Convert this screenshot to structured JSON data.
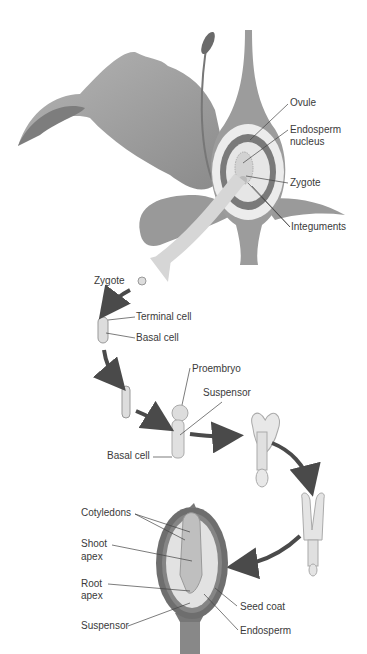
{
  "diagram": {
    "flower_labels": {
      "ovule": "Ovule",
      "endosperm_nucleus_line1": "Endosperm",
      "endosperm_nucleus_line2": "nucleus",
      "zygote": "Zygote",
      "integuments": "Integuments"
    },
    "stage_labels": {
      "zygote": "Zygote",
      "terminal_cell": "Terminal cell",
      "basal_cell_1": "Basal cell",
      "proembryo": "Proembryo",
      "suspensor": "Suspensor",
      "basal_cell_2": "Basal cell"
    },
    "seed_labels": {
      "cotyledons": "Cotyledons",
      "shoot_apex_line1": "Shoot",
      "shoot_apex_line2": "apex",
      "root_apex_line1": "Root",
      "root_apex_line2": "apex",
      "suspensor": "Suspensor",
      "seed_coat": "Seed coat",
      "endosperm": "Endosperm"
    },
    "colors": {
      "petal": "#a9a9a9",
      "petal_dark": "#7d7d7d",
      "arrow": "#4a4a4a",
      "pale_arrow": "#d6d6d6",
      "seed_coat": "#6e6e6e",
      "embryo": "#cfcfcf",
      "text": "#3a3a3a"
    }
  }
}
